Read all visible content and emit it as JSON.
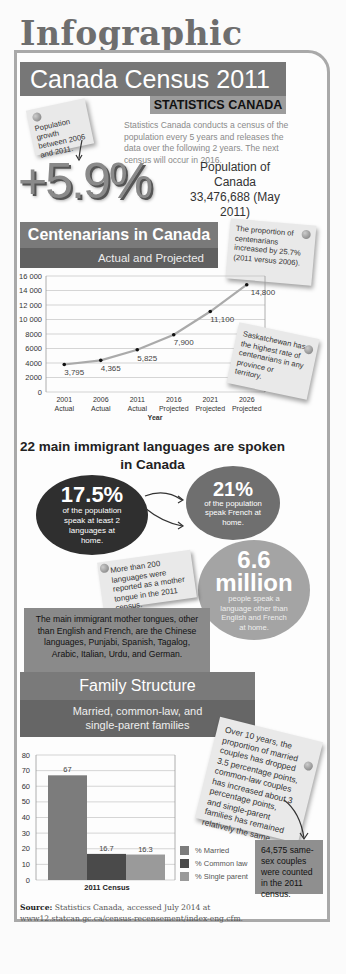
{
  "page_title": "Infographic",
  "header": {
    "title": "Canada Census 2011",
    "subtitle": "STATISTICS CANADA",
    "growth_note": "Population growth between 2006 and 2011.",
    "description": "Statistics Canada conducts a census of the population every 5 years and releases the data over the following 2 years. The next census will occur in 2016.",
    "growth_value": "+5.9%",
    "population_label": "Population of Canada",
    "population_value": "33,476,688 (May 2011)"
  },
  "centenarians": {
    "title": "Centenarians in Canada",
    "subtitle": "Actual and Projected",
    "note_increase": "The proportion of centenarians increased by 25.7% (2011 versus 2006).",
    "note_sask": "Saskatchewan has the highest rate of centenarians in any province or territory.",
    "xlabel": "Year"
  },
  "languages": {
    "title_line1": "22 main immigrant languages are spoken",
    "title_line2": "in Canada",
    "c1_value": "17.5%",
    "c1_text": "of the population speak at least 2 languages at home.",
    "c2_value": "21%",
    "c2_text": "of the population speak French at home.",
    "c3_value_1": "6.6",
    "c3_value_2": "million",
    "c3_text": "people speak a language other than English and French at home.",
    "note_200": "More than 200 languages were reported as a mother tongue in the 2011 census.",
    "tongues": "The main immigrant mother tongues, other than English and French, are the Chinese languages, Punjabi, Spanish, Tagalog, Arabic, Italian, Urdu, and German."
  },
  "family": {
    "title": "Family Structure",
    "subtitle_line1": "Married, common-law, and",
    "subtitle_line2": "single-parent families",
    "note": "Over 10 years, the proportion of married couples has dropped 3.5 percentage points, common-law couples has increased about 3 percentage points, and single-parent families has remained relatively the same.",
    "samesex": "64,575 same-sex couples were counted in the 2011 census.",
    "legend": [
      "% Married",
      "% Common law",
      "% Single parent"
    ],
    "xlabel": "2011 Census"
  },
  "source": {
    "label": "Source:",
    "text": "Statistics Canada, accessed July 2014 at www12.statcan.gc.ca/census-recensement/index-eng.cfm."
  },
  "chart_data": [
    {
      "type": "line",
      "title": "Centenarians in Canada — Actual and Projected",
      "categories": [
        "2001 Actual",
        "2006 Actual",
        "2011 Actual",
        "2016 Projected",
        "2021 Projected",
        "2026 Projected"
      ],
      "values": [
        3795,
        4365,
        5825,
        7900,
        11100,
        14800
      ],
      "value_labels": [
        "3,795",
        "4,365",
        "5,825",
        "7,900",
        "11,100",
        "14,800"
      ],
      "xlabel": "Year",
      "ylabel": "",
      "ylim": [
        0,
        16000
      ],
      "yticks": [
        "0",
        "2000",
        "4000",
        "6000",
        "8000",
        "10 000",
        "12 000",
        "14 000",
        "16 000"
      ],
      "grid": true
    },
    {
      "type": "bar",
      "title": "Family Structure",
      "categories": [
        "2011 Census"
      ],
      "series": [
        {
          "name": "% Married",
          "values": [
            67
          ],
          "color": "#7c7c7c"
        },
        {
          "name": "% Common law",
          "values": [
            16.7
          ],
          "color": "#4a4a4a"
        },
        {
          "name": "% Single parent",
          "values": [
            16.3
          ],
          "color": "#9a9a9a"
        }
      ],
      "value_labels": [
        "67",
        "16.7",
        "16.3"
      ],
      "xlabel": "2011 Census",
      "ylim": [
        0,
        80
      ],
      "yticks": [
        "0",
        "10",
        "20",
        "30",
        "40",
        "50",
        "60",
        "70",
        "80"
      ],
      "grid": true,
      "legend_position": "right"
    }
  ]
}
